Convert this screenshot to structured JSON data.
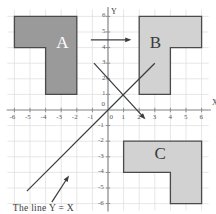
{
  "figure": {
    "title": "",
    "caption": "The line Y = X",
    "background_color": "#ffffff",
    "grid_color": "#dcdcdc",
    "axis_color": "#8a8d90"
  },
  "axes": {
    "x_name": "X",
    "y_name": "Y",
    "x_ticks": [
      "-6",
      "-5",
      "-4",
      "-3",
      "-2",
      "-1",
      "0",
      "1",
      "2",
      "3",
      "4",
      "5",
      "6"
    ],
    "y_ticks": [
      "6",
      "5",
      "4",
      "3",
      "2",
      "1",
      "0",
      "-1",
      "-2",
      "-3",
      "-4",
      "-5",
      "-6"
    ],
    "origin_label": "0",
    "xlim": [
      -6.4,
      6.4
    ],
    "ylim": [
      -6.4,
      6.4
    ],
    "grid": true
  },
  "chart_data": {
    "type": "diagram",
    "title": "",
    "xlabel": "X",
    "ylabel": "Y",
    "xlim": [
      -6.4,
      6.4
    ],
    "ylim": [
      -6.4,
      6.4
    ],
    "grid": true,
    "shapes": [
      {
        "name": "A",
        "label": "A",
        "label_color": "#ffffff",
        "fill": "#9a9a9a",
        "stroke": "#4a4a4a",
        "vertices": [
          [
            -6,
            6
          ],
          [
            -2,
            6
          ],
          [
            -2,
            1
          ],
          [
            -4,
            1
          ],
          [
            -4,
            4
          ],
          [
            -6,
            4
          ]
        ]
      },
      {
        "name": "B",
        "label": "B",
        "label_color": "#3a3a3a",
        "fill": "#d2d2d2",
        "stroke": "#4a4a4a",
        "vertices": [
          [
            2,
            6
          ],
          [
            6,
            6
          ],
          [
            6,
            4
          ],
          [
            4,
            4
          ],
          [
            4,
            1
          ],
          [
            2,
            1
          ]
        ]
      },
      {
        "name": "C",
        "label": "C",
        "label_color": "#3a3a3a",
        "fill": "#d2d2d2",
        "stroke": "#4a4a4a",
        "vertices": [
          [
            1,
            -2
          ],
          [
            6,
            -2
          ],
          [
            6,
            -6
          ],
          [
            4,
            -6
          ],
          [
            4,
            -4
          ],
          [
            1,
            -4
          ]
        ]
      }
    ],
    "lines": [
      {
        "name": "line-y-equals-x",
        "equation": "Y = X",
        "from": [
          -5.2,
          -5.2
        ],
        "to": [
          3.0,
          3.0
        ],
        "stroke": "#3a3d40",
        "arrow": "none"
      }
    ],
    "arrows": [
      {
        "name": "translation-arrow-a-to-b",
        "from": [
          -1.1,
          4.5
        ],
        "to": [
          1.5,
          4.5
        ],
        "stroke": "#3a3d40"
      },
      {
        "name": "reflection-arrow-a-to-c",
        "from": [
          -0.9,
          3.0
        ],
        "to": [
          2.4,
          -0.6
        ],
        "stroke": "#3a3d40"
      },
      {
        "name": "caption-pointer-arrow",
        "from": [
          -3.6,
          -5.9
        ],
        "to": [
          -2.5,
          -4.2
        ],
        "stroke": "#3a3d40"
      }
    ]
  }
}
